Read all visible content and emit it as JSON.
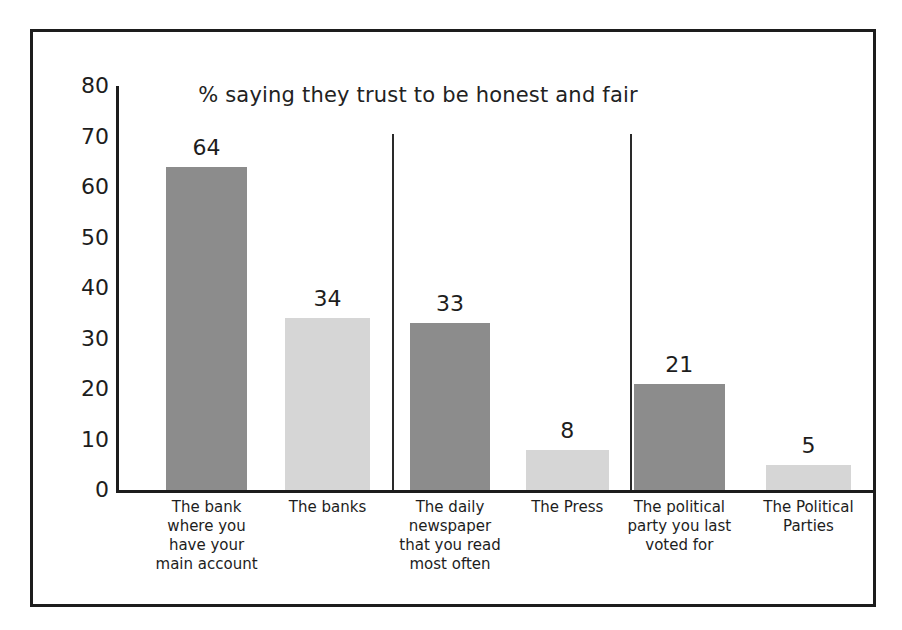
{
  "chart_data": {
    "type": "bar",
    "title": "% saying they trust to be honest and fair",
    "xlabel": "",
    "ylabel": "",
    "ylim": [
      0,
      80
    ],
    "yticks": [
      "80",
      "70",
      "60",
      "50",
      "40",
      "30",
      "20",
      "10",
      "0"
    ],
    "grid": false,
    "legend": "none",
    "categories": [
      "The bank where you have your main account",
      "The banks",
      "The daily newspaper that you read most often",
      "The Press",
      "The political party you last voted for",
      "The Political Parties"
    ],
    "category_lines": [
      [
        "The bank",
        "where you",
        "have your",
        "main account"
      ],
      [
        "The banks"
      ],
      [
        "The daily",
        "newspaper",
        "that you read",
        "most often"
      ],
      [
        "The Press"
      ],
      [
        "The political",
        "party you last",
        "voted for"
      ],
      [
        "The Political",
        "Parties"
      ]
    ],
    "values": [
      64,
      34,
      33,
      8,
      21,
      5
    ],
    "value_labels": [
      "64",
      "34",
      "33",
      "8",
      "21",
      "5"
    ],
    "bar_shades": [
      "dark",
      "light",
      "dark",
      "light",
      "dark",
      "light"
    ],
    "groups": [
      {
        "name": "Banking",
        "category_indices": [
          0,
          1
        ]
      },
      {
        "name": "Press",
        "category_indices": [
          2,
          3
        ]
      },
      {
        "name": "Politics",
        "category_indices": [
          4,
          5
        ]
      }
    ],
    "group_divider_count": 2,
    "colors": {
      "dark_bar": "#8c8c8c",
      "light_bar": "#d6d6d6",
      "axis": "#1d1d1d",
      "text": "#1d1d1d",
      "background": "#ffffff",
      "frame": "#1d1d1d"
    }
  }
}
